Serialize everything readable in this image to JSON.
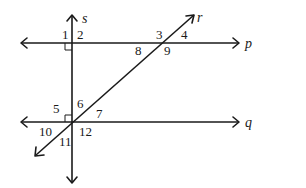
{
  "diagram": {
    "lines": {
      "p": "p",
      "q": "q",
      "r": "r",
      "s": "s"
    },
    "angles": [
      "1",
      "2",
      "3",
      "4",
      "5",
      "6",
      "7",
      "8",
      "9",
      "10",
      "11",
      "12"
    ],
    "right_angle_marks": [
      "s-p intersection (angle 1)",
      "s-q intersection (angle 5)"
    ]
  }
}
